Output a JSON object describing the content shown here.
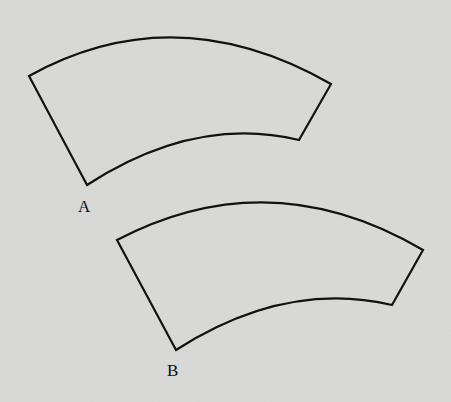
{
  "figures": [
    {
      "id": "A",
      "label": "A",
      "type": "annular-sector"
    },
    {
      "id": "B",
      "label": "B",
      "type": "annular-sector"
    }
  ],
  "colors": {
    "background": "#d9d9d7",
    "stroke": "#111111"
  }
}
